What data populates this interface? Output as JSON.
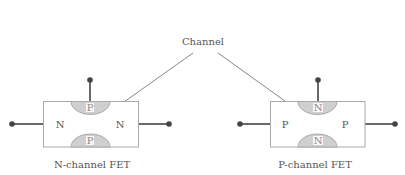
{
  "annotation": {
    "label": "Channel"
  },
  "devices": [
    {
      "caption": "N-channel FET",
      "channel_type": "N",
      "gate_type": "P",
      "left_region": "N",
      "right_region": "N",
      "top_gate": "P",
      "bottom_gate": "P"
    },
    {
      "caption": "P-channel FET",
      "channel_type": "P",
      "gate_type": "N",
      "left_region": "P",
      "right_region": "P",
      "top_gate": "N",
      "bottom_gate": "N"
    }
  ],
  "colors": {
    "outline": "#aaaaaa",
    "gate_fill": "#cfcfcf",
    "terminal": "#444444",
    "arrow": "#888888",
    "text": "#555555"
  }
}
